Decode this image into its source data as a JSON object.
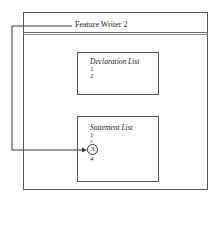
{
  "window": {
    "title": "Feature Writer 2"
  },
  "declaration_list": {
    "title": "Declaration List",
    "items": [
      "1",
      "2"
    ]
  },
  "statement_list": {
    "title": "Statement List",
    "items": [
      "1",
      "2",
      "3",
      "4"
    ],
    "highlighted_item": "3"
  },
  "connector": {
    "from": "Feature Writer 2",
    "to": "Statement List item 3"
  }
}
